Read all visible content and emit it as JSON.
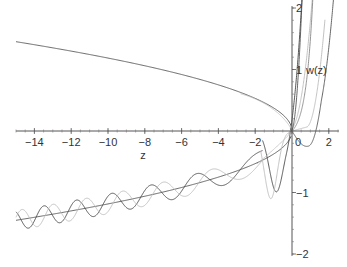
{
  "chart_data": {
    "type": "line",
    "title": "",
    "xlabel": "z",
    "ylabel": "w(z)",
    "xlim": [
      -15,
      2.5
    ],
    "ylim": [
      -2,
      2
    ],
    "x_ticks": [
      -14,
      -12,
      -10,
      -8,
      -6,
      -4,
      -2,
      0,
      2
    ],
    "x_tick_labels": [
      "−14",
      "−12",
      "−10",
      "−8",
      "−6",
      "−4",
      "−2",
      "0",
      "2"
    ],
    "y_ticks": [
      -2,
      -1,
      1,
      2
    ],
    "y_tick_labels": [
      "−2",
      "−1",
      "1",
      "2"
    ],
    "grid": false,
    "legend": null,
    "series": [
      {
        "name": "upper-monotone-dark",
        "description": "dark curve decreasing from ~1.45 at z=-15 to 0 at z=0, then rising steeply",
        "points": [
          [
            -15,
            1.45
          ],
          [
            -12,
            1.28
          ],
          [
            -8,
            1.02
          ],
          [
            -4,
            0.68
          ],
          [
            -2,
            0.44
          ],
          [
            -1,
            0.27
          ],
          [
            0,
            0.02
          ],
          [
            0.3,
            0.5
          ],
          [
            0.6,
            2
          ]
        ]
      },
      {
        "name": "lower-monotone-dark",
        "description": "dark curve increasing from ~-1.45 at z=-15 to 0 at z=0",
        "points": [
          [
            -15,
            -1.45
          ],
          [
            -12,
            -1.28
          ],
          [
            -8,
            -1.02
          ],
          [
            -4,
            -0.68
          ],
          [
            -2,
            -0.44
          ],
          [
            -1,
            -0.25
          ],
          [
            0,
            0
          ]
        ]
      },
      {
        "name": "oscillating-dark",
        "description": "dark oscillatory curve, amplitude growing toward z=0, min near z=-0.8 at about -1.0",
        "points": [
          [
            -15,
            -1.25
          ],
          [
            -10,
            -0.9
          ],
          [
            -5,
            -0.55
          ],
          [
            -2,
            -0.3
          ],
          [
            -0.8,
            -1.0
          ],
          [
            0,
            0
          ],
          [
            0.8,
            2
          ]
        ]
      },
      {
        "name": "oscillating-light",
        "description": "light grey oscillatory curve phase-shifted from the dark one, min near z=-1.2 at about -1.1",
        "points": [
          [
            -15,
            -1.3
          ],
          [
            -10,
            -0.92
          ],
          [
            -5,
            -0.6
          ],
          [
            -1.2,
            -1.1
          ],
          [
            0,
            0
          ],
          [
            1.3,
            2
          ]
        ]
      },
      {
        "name": "right-dip-dark",
        "description": "curve dipping below 0 near z=0.9 (~-0.2) before rising steeply",
        "points": [
          [
            0,
            0
          ],
          [
            0.5,
            -0.15
          ],
          [
            0.9,
            -0.22
          ],
          [
            1.5,
            0.2
          ],
          [
            2.2,
            2
          ]
        ]
      },
      {
        "name": "right-rise-light",
        "description": "light curves rising steeply near z=1..2",
        "points": [
          [
            0,
            0
          ],
          [
            0.7,
            0.05
          ],
          [
            1.2,
            0.6
          ],
          [
            1.6,
            2
          ]
        ]
      }
    ]
  }
}
